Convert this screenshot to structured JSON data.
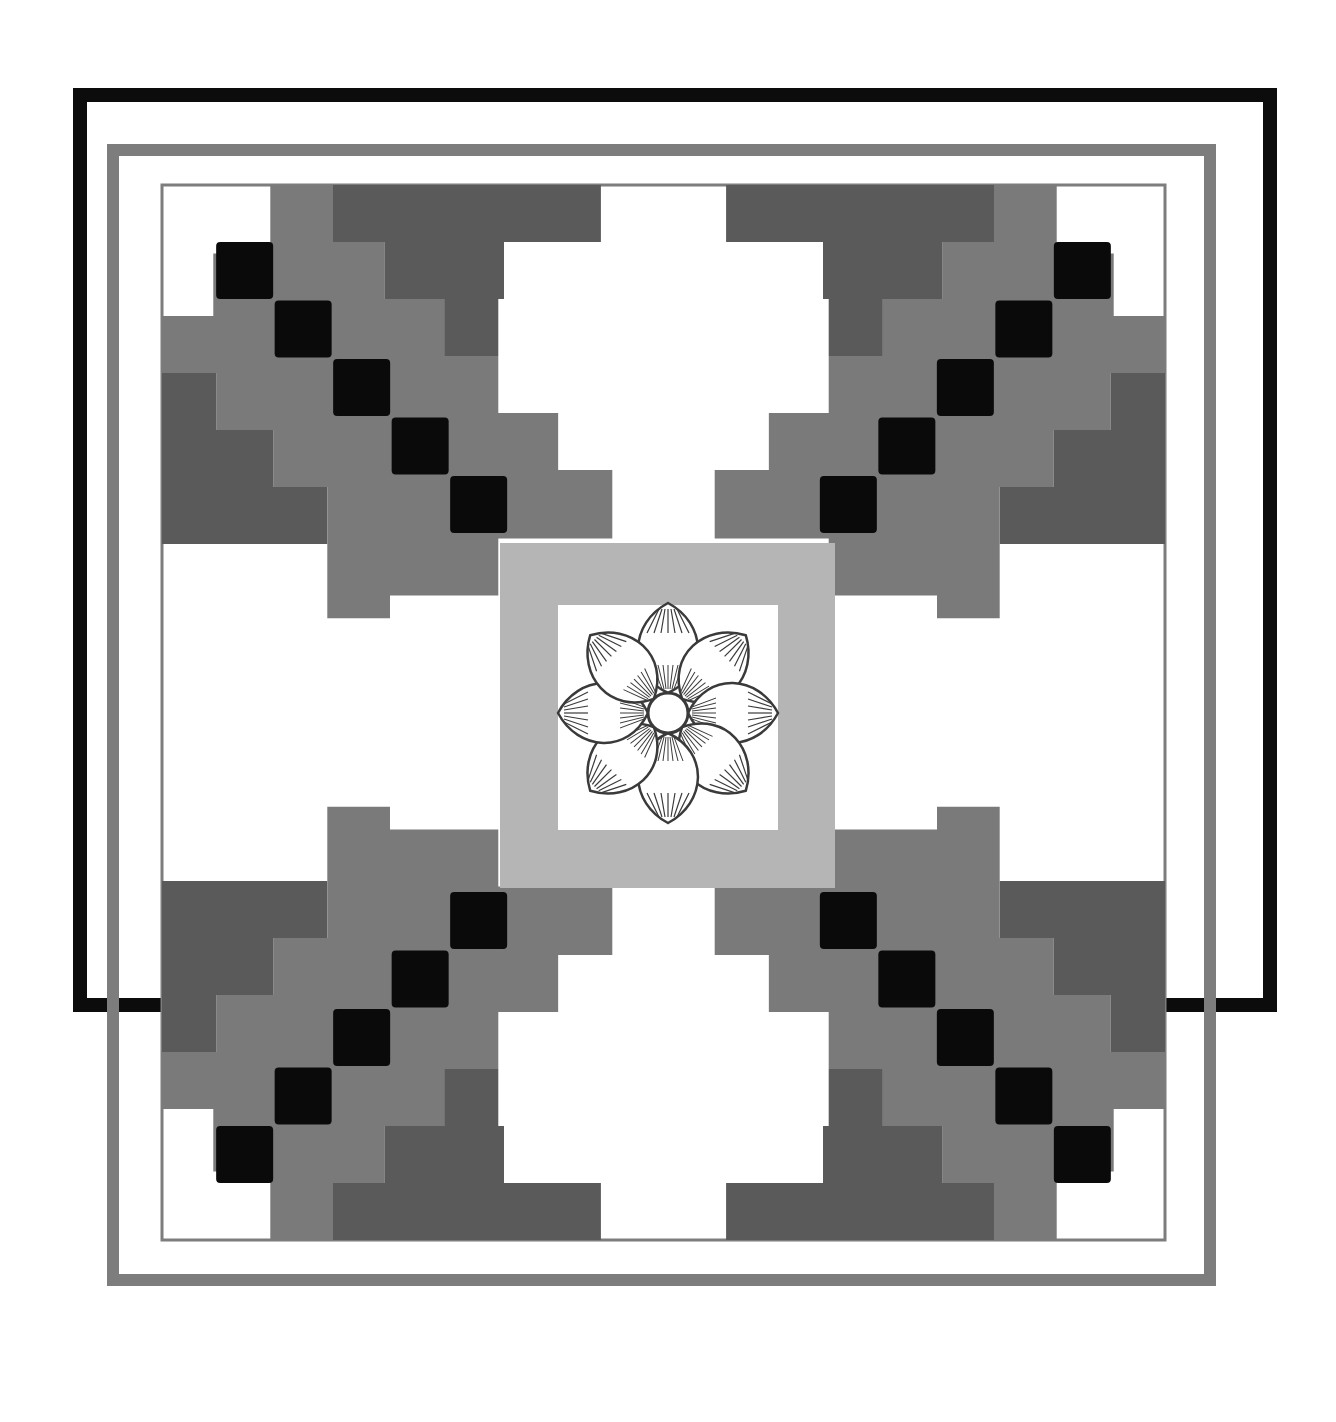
{
  "artwork": {
    "title": "",
    "colors": {
      "background": "#ffffff",
      "frame": "#0c0c0c",
      "band": "#7d7d7d",
      "black": "#0a0a0a",
      "dark": "#5a5a5a",
      "mid": "#7a7a7a",
      "light": "#b5b5b5",
      "white": "#ffffff",
      "flower_line": "#3a3a3a"
    },
    "outer_frame": {
      "x": 80,
      "y": 95,
      "w": 1190,
      "h": 905,
      "stroke": 14
    },
    "grey_band": {
      "x": 113,
      "y": 150,
      "w": 1097,
      "h": 1130,
      "stroke": 12
    },
    "pattern_area": {
      "x": 162,
      "y": 185,
      "w": 1003,
      "h": 1055
    },
    "cell": 57,
    "quadrant_tl": {
      "dark": [
        [
          0,
          2,
          6,
          1
        ],
        [
          2,
          1,
          4,
          1
        ],
        [
          3,
          2,
          3,
          1
        ],
        [
          5,
          3,
          2,
          1
        ],
        [
          0,
          3,
          1,
          3
        ],
        [
          0,
          4,
          2,
          1
        ],
        [
          0,
          5,
          3,
          1
        ],
        [
          0,
          6,
          4,
          1
        ]
      ],
      "mid": [
        [
          0,
          1,
          1,
          2
        ],
        [
          0,
          2,
          5,
          1
        ],
        [
          1,
          3,
          6,
          1
        ],
        [
          2,
          4,
          6,
          1
        ],
        [
          3,
          5,
          5,
          1
        ],
        [
          4,
          6,
          3,
          1
        ],
        [
          1,
          1,
          1,
          1
        ],
        [
          2,
          0,
          1,
          1
        ]
      ],
      "black": [
        [
          1,
          1
        ],
        [
          2,
          2
        ],
        [
          3,
          3
        ],
        [
          4,
          4
        ],
        [
          5,
          5
        ]
      ]
    },
    "center": {
      "outer": {
        "x": 500,
        "y": 543,
        "w": 335,
        "h": 345
      },
      "inner": {
        "x": 558,
        "y": 605,
        "w": 220,
        "h": 225
      },
      "flower": {
        "cx": 668,
        "cy": 713,
        "petals": 8,
        "petal_length": 110,
        "petal_width": 42,
        "core_radius": 20
      }
    }
  }
}
